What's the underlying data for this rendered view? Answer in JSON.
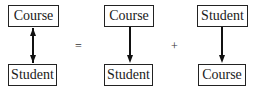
{
  "diagram": {
    "groups": [
      {
        "id": "bidirectional",
        "top": {
          "label": "Course"
        },
        "bottom": {
          "label": "Student"
        },
        "arrow": "double-headed"
      },
      {
        "id": "course-to-student",
        "top": {
          "label": "Course"
        },
        "bottom": {
          "label": "Student"
        },
        "arrow": "down"
      },
      {
        "id": "student-to-course",
        "top": {
          "label": "Student"
        },
        "bottom": {
          "label": "Course"
        },
        "arrow": "down"
      }
    ],
    "operators": {
      "equals": "=",
      "plus": "+"
    }
  }
}
